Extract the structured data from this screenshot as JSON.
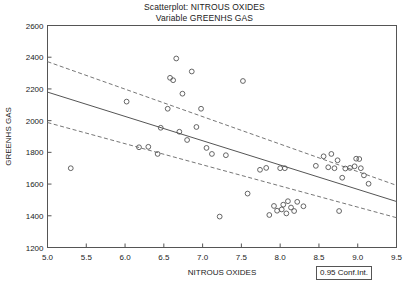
{
  "title": {
    "line1": "Scatterplot: NITROUS OXIDES",
    "line2": "Variable GREENHS GAS"
  },
  "legend": {
    "label": "0.95 Conf.Int."
  },
  "colors": {
    "marker": "#555555",
    "frame": "#555555",
    "regression": "#555555",
    "confidence": "#777777",
    "text": "#222222",
    "background": "#ffffff"
  },
  "chart_data": {
    "type": "scatter",
    "title": "Scatterplot: NITROUS OXIDES\nVariable GREENHS GAS",
    "xlabel": "NITROUS OXIDES",
    "ylabel": "GREENHS GAS",
    "xlim": [
      5.0,
      9.5
    ],
    "ylim": [
      1200,
      2600
    ],
    "xticks": [
      "5.0",
      "5.5",
      "6.0",
      "6.5",
      "7.0",
      "7.5",
      "8.0",
      "8.5",
      "9.0",
      "9.5"
    ],
    "xtick_values": [
      5.0,
      5.5,
      6.0,
      6.5,
      7.0,
      7.5,
      8.0,
      8.5,
      9.0,
      9.5
    ],
    "yticks": [
      "1200",
      "1400",
      "1600",
      "1800",
      "2000",
      "2200",
      "2400",
      "2600"
    ],
    "ytick_values": [
      1200,
      1400,
      1600,
      1800,
      2000,
      2200,
      2400,
      2600
    ],
    "grid": false,
    "legend_position": "bottom-right",
    "legend_entries": [
      "0.95 Conf.Int."
    ],
    "marker": "open-circle",
    "points": [
      [
        5.3,
        1700
      ],
      [
        6.02,
        2120
      ],
      [
        6.18,
        1832
      ],
      [
        6.3,
        1835
      ],
      [
        6.42,
        1790
      ],
      [
        6.46,
        1955
      ],
      [
        6.55,
        2075
      ],
      [
        6.58,
        2270
      ],
      [
        6.62,
        2255
      ],
      [
        6.66,
        2392
      ],
      [
        6.7,
        1930
      ],
      [
        6.74,
        2170
      ],
      [
        6.8,
        1878
      ],
      [
        6.86,
        2310
      ],
      [
        6.92,
        1960
      ],
      [
        6.98,
        2075
      ],
      [
        7.05,
        1828
      ],
      [
        7.12,
        1790
      ],
      [
        7.22,
        1395
      ],
      [
        7.3,
        1782
      ],
      [
        7.52,
        2250
      ],
      [
        7.58,
        1540
      ],
      [
        7.74,
        1690
      ],
      [
        7.82,
        1702
      ],
      [
        7.86,
        1405
      ],
      [
        7.92,
        1462
      ],
      [
        7.96,
        1432
      ],
      [
        8.0,
        1700
      ],
      [
        8.02,
        1440
      ],
      [
        8.04,
        1470
      ],
      [
        8.06,
        1700
      ],
      [
        8.08,
        1415
      ],
      [
        8.1,
        1492
      ],
      [
        8.14,
        1452
      ],
      [
        8.18,
        1430
      ],
      [
        8.22,
        1488
      ],
      [
        8.3,
        1460
      ],
      [
        8.46,
        1715
      ],
      [
        8.56,
        1775
      ],
      [
        8.62,
        1706
      ],
      [
        8.66,
        1790
      ],
      [
        8.7,
        1700
      ],
      [
        8.74,
        1750
      ],
      [
        8.76,
        1430
      ],
      [
        8.8,
        1640
      ],
      [
        8.84,
        1698
      ],
      [
        8.9,
        1702
      ],
      [
        8.96,
        1712
      ],
      [
        8.98,
        1760
      ],
      [
        9.02,
        1758
      ],
      [
        9.04,
        1700
      ],
      [
        9.08,
        1655
      ],
      [
        9.14,
        1602
      ]
    ],
    "regression_line": {
      "label": "regression",
      "x": [
        5.0,
        9.5
      ],
      "y": [
        2180,
        1490
      ],
      "style": "solid"
    },
    "confidence_bands": [
      {
        "label": "upper 0.95 conf. int.",
        "x": [
          5.0,
          9.5
        ],
        "y": [
          2372,
          1592
        ],
        "style": "dashed"
      },
      {
        "label": "lower 0.95 conf. int.",
        "x": [
          5.0,
          9.5
        ],
        "y": [
          1988,
          1388
        ],
        "style": "dashed"
      }
    ]
  }
}
